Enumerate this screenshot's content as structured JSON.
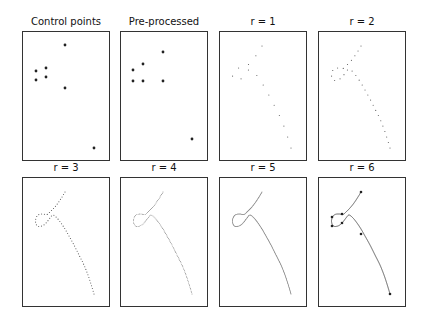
{
  "figure": {
    "panels": [
      {
        "id": "control",
        "title": "Control points",
        "x": 22,
        "y": 31,
        "mode": "control"
      },
      {
        "id": "pre",
        "title": "Pre-processed",
        "x": 120,
        "y": 31,
        "mode": "pre"
      },
      {
        "id": "r1",
        "title": "r = 1",
        "x": 219,
        "y": 31,
        "mode": "dots",
        "samples": 14
      },
      {
        "id": "r2",
        "title": "r = 2",
        "x": 318,
        "y": 31,
        "mode": "dots",
        "samples": 28
      },
      {
        "id": "r3",
        "title": "r = 3",
        "x": 22,
        "y": 177,
        "mode": "dots",
        "samples": 56
      },
      {
        "id": "r4",
        "title": "r = 4",
        "x": 120,
        "y": 177,
        "mode": "dots",
        "samples": 112
      },
      {
        "id": "r5",
        "title": "r = 5",
        "x": 219,
        "y": 177,
        "mode": "dots",
        "samples": 224
      },
      {
        "id": "r6",
        "title": "r = 6",
        "x": 318,
        "y": 177,
        "mode": "final"
      }
    ],
    "control_points": [
      [
        43,
        14
      ],
      [
        24,
        37
      ],
      [
        14,
        40
      ],
      [
        24,
        46
      ],
      [
        14,
        49
      ],
      [
        43,
        57
      ],
      [
        72,
        117
      ]
    ],
    "preprocessed_points": [
      [
        43,
        21
      ],
      [
        23,
        33
      ],
      [
        13,
        39
      ],
      [
        13,
        50
      ],
      [
        23,
        50
      ],
      [
        43,
        50
      ],
      [
        72,
        108
      ]
    ],
    "final_points": [
      [
        43,
        15
      ],
      [
        24,
        37
      ],
      [
        14,
        40
      ],
      [
        24,
        46
      ],
      [
        14,
        49
      ],
      [
        43,
        57
      ],
      [
        72,
        117
      ]
    ],
    "colors": {
      "frame": "#333333",
      "point": "#222222",
      "curve": "#333333"
    }
  }
}
